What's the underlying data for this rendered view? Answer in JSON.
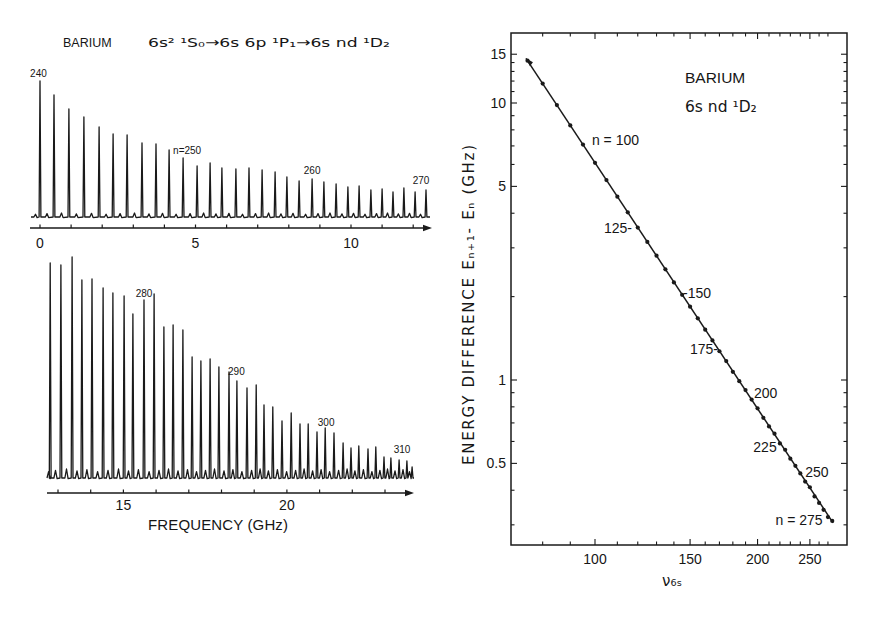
{
  "figure": {
    "left_title_element": "BARIUM",
    "left_title_transition": "6s² ¹S₀→6s 6p  ¹P₁→6s nd  ¹D₂",
    "bottom_xlabel": "FREQUENCY (GHz)",
    "right_legend_line1": "BARIUM",
    "right_legend_line2": "6s nd ¹D₂",
    "right_xlabel": "ν₆ₛ",
    "right_ylabel": "ENERGY DIFFERENCE  Eₙ₊₁- Eₙ  (GHz)"
  },
  "chart_data": [
    {
      "id": "spectrum_top",
      "type": "line",
      "title": "BARIUM 6s² ¹S₀→6s 6p ¹P₁→6s nd ¹D₂",
      "xlabel": "",
      "ylabel": "",
      "xlim": [
        -0.3,
        12.6
      ],
      "grid": false,
      "x_ticks": [
        0,
        1,
        2,
        3,
        4,
        5,
        6,
        7,
        8,
        9,
        10,
        11,
        12
      ],
      "x_tick_labels": [
        0,
        5,
        10
      ],
      "peaks": [
        {
          "n": 240,
          "freq_ghz": 0.0,
          "intensity": 136
        },
        {
          "n": 241,
          "freq_ghz": 0.45,
          "intensity": 122
        },
        {
          "n": 242,
          "freq_ghz": 0.93,
          "intensity": 108
        },
        {
          "n": 243,
          "freq_ghz": 1.41,
          "intensity": 100
        },
        {
          "n": 244,
          "freq_ghz": 1.9,
          "intensity": 90
        },
        {
          "n": 245,
          "freq_ghz": 2.35,
          "intensity": 83
        },
        {
          "n": 246,
          "freq_ghz": 2.8,
          "intensity": 82
        },
        {
          "n": 247,
          "freq_ghz": 3.28,
          "intensity": 74
        },
        {
          "n": 248,
          "freq_ghz": 3.73,
          "intensity": 73
        },
        {
          "n": 249,
          "freq_ghz": 4.15,
          "intensity": 67
        },
        {
          "n": 250,
          "freq_ghz": 4.6,
          "intensity": 59
        },
        {
          "n": 251,
          "freq_ghz": 5.05,
          "intensity": 51
        },
        {
          "n": 252,
          "freq_ghz": 5.47,
          "intensity": 54
        },
        {
          "n": 253,
          "freq_ghz": 5.85,
          "intensity": 49
        },
        {
          "n": 254,
          "freq_ghz": 6.3,
          "intensity": 48
        },
        {
          "n": 255,
          "freq_ghz": 6.72,
          "intensity": 49
        },
        {
          "n": 256,
          "freq_ghz": 7.14,
          "intensity": 47
        },
        {
          "n": 257,
          "freq_ghz": 7.56,
          "intensity": 45
        },
        {
          "n": 258,
          "freq_ghz": 7.94,
          "intensity": 40
        },
        {
          "n": 259,
          "freq_ghz": 8.33,
          "intensity": 36
        },
        {
          "n": 260,
          "freq_ghz": 8.75,
          "intensity": 38
        },
        {
          "n": 261,
          "freq_ghz": 9.13,
          "intensity": 35
        },
        {
          "n": 262,
          "freq_ghz": 9.52,
          "intensity": 33
        },
        {
          "n": 263,
          "freq_ghz": 9.9,
          "intensity": 30
        },
        {
          "n": 264,
          "freq_ghz": 10.26,
          "intensity": 31
        },
        {
          "n": 265,
          "freq_ghz": 10.64,
          "intensity": 27
        },
        {
          "n": 266,
          "freq_ghz": 11.0,
          "intensity": 28
        },
        {
          "n": 267,
          "freq_ghz": 11.35,
          "intensity": 25
        },
        {
          "n": 268,
          "freq_ghz": 11.7,
          "intensity": 29
        },
        {
          "n": 269,
          "freq_ghz": 12.06,
          "intensity": 25
        },
        {
          "n": 270,
          "freq_ghz": 12.41,
          "intensity": 27
        }
      ],
      "annotations": [
        {
          "text": "240",
          "freq_ghz": -0.05,
          "height": 140,
          "anchor": "middle"
        },
        {
          "text": "n=250",
          "freq_ghz": 4.28,
          "height": 63,
          "anchor": "start"
        },
        {
          "text": "260",
          "freq_ghz": 8.75,
          "height": 43,
          "anchor": "middle"
        },
        {
          "text": "270",
          "freq_ghz": 12.25,
          "height": 33,
          "anchor": "middle"
        }
      ]
    },
    {
      "id": "spectrum_bottom",
      "type": "line",
      "title": "",
      "xlabel": "FREQUENCY (GHz)",
      "ylabel": "",
      "xlim": [
        12.65,
        23.9
      ],
      "grid": false,
      "x_ticks": [
        13,
        14,
        15,
        16,
        17,
        18,
        19,
        20,
        21,
        22,
        23
      ],
      "x_tick_labels": [
        15,
        20
      ],
      "peaks": [
        {
          "n": 271,
          "freq_ghz": 12.76,
          "intensity": 215
        },
        {
          "n": 272,
          "freq_ghz": 13.09,
          "intensity": 213
        },
        {
          "n": 273,
          "freq_ghz": 13.43,
          "intensity": 221
        },
        {
          "n": 274,
          "freq_ghz": 13.73,
          "intensity": 198
        },
        {
          "n": 275,
          "freq_ghz": 14.04,
          "intensity": 199
        },
        {
          "n": 276,
          "freq_ghz": 14.38,
          "intensity": 190
        },
        {
          "n": 277,
          "freq_ghz": 14.68,
          "intensity": 185
        },
        {
          "n": 278,
          "freq_ghz": 15.02,
          "intensity": 182
        },
        {
          "n": 279,
          "freq_ghz": 15.29,
          "intensity": 164
        },
        {
          "n": 280,
          "freq_ghz": 15.63,
          "intensity": 178
        },
        {
          "n": 281,
          "freq_ghz": 15.94,
          "intensity": 184
        },
        {
          "n": 282,
          "freq_ghz": 16.24,
          "intensity": 151
        },
        {
          "n": 283,
          "freq_ghz": 16.52,
          "intensity": 153
        },
        {
          "n": 284,
          "freq_ghz": 16.82,
          "intensity": 148
        },
        {
          "n": 285,
          "freq_ghz": 17.1,
          "intensity": 121
        },
        {
          "n": 286,
          "freq_ghz": 17.37,
          "intensity": 117
        },
        {
          "n": 287,
          "freq_ghz": 17.65,
          "intensity": 119
        },
        {
          "n": 288,
          "freq_ghz": 17.92,
          "intensity": 111
        },
        {
          "n": 289,
          "freq_ghz": 18.23,
          "intensity": 106
        },
        {
          "n": 290,
          "freq_ghz": 18.47,
          "intensity": 97
        },
        {
          "n": 291,
          "freq_ghz": 18.78,
          "intensity": 90
        },
        {
          "n": 292,
          "freq_ghz": 19.06,
          "intensity": 93
        },
        {
          "n": 293,
          "freq_ghz": 19.3,
          "intensity": 73
        },
        {
          "n": 294,
          "freq_ghz": 19.57,
          "intensity": 71
        },
        {
          "n": 295,
          "freq_ghz": 19.85,
          "intensity": 57
        },
        {
          "n": 296,
          "freq_ghz": 20.13,
          "intensity": 65
        },
        {
          "n": 297,
          "freq_ghz": 20.4,
          "intensity": 54
        },
        {
          "n": 298,
          "freq_ghz": 20.65,
          "intensity": 54
        },
        {
          "n": 299,
          "freq_ghz": 20.92,
          "intensity": 46
        },
        {
          "n": 300,
          "freq_ghz": 21.17,
          "intensity": 50
        },
        {
          "n": 301,
          "freq_ghz": 21.44,
          "intensity": 45
        },
        {
          "n": 302,
          "freq_ghz": 21.72,
          "intensity": 35
        },
        {
          "n": 303,
          "freq_ghz": 21.96,
          "intensity": 30
        },
        {
          "n": 304,
          "freq_ghz": 22.2,
          "intensity": 32
        },
        {
          "n": 305,
          "freq_ghz": 22.48,
          "intensity": 29
        },
        {
          "n": 306,
          "freq_ghz": 22.72,
          "intensity": 31
        },
        {
          "n": 307,
          "freq_ghz": 22.97,
          "intensity": 21
        },
        {
          "n": 308,
          "freq_ghz": 23.18,
          "intensity": 20
        },
        {
          "n": 309,
          "freq_ghz": 23.43,
          "intensity": 18
        },
        {
          "n": 310,
          "freq_ghz": 23.67,
          "intensity": 17
        },
        {
          "n": 311,
          "freq_ghz": 23.83,
          "intensity": 11
        }
      ],
      "annotations": [
        {
          "text": "280",
          "freq_ghz": 15.63,
          "height": 181,
          "anchor": "middle"
        },
        {
          "text": "290",
          "freq_ghz": 18.2,
          "height": 103,
          "anchor": "start"
        },
        {
          "text": "300",
          "freq_ghz": 21.2,
          "height": 52,
          "anchor": "middle"
        },
        {
          "text": "310",
          "freq_ghz": 23.52,
          "height": 25,
          "anchor": "middle"
        }
      ]
    },
    {
      "id": "energy_difference",
      "type": "scatter",
      "title": "",
      "legend": [
        "BARIUM",
        "6s nd ¹D₂"
      ],
      "xlabel": "ν₆ₛ",
      "ylabel": "ENERGY DIFFERENCE Eₙ₊₁ - Eₙ (GHz)",
      "x_scale": "log",
      "y_scale": "log",
      "xlim": [
        70,
        293
      ],
      "ylim": [
        0.254,
        17.9
      ],
      "grid": false,
      "x_ticks": [
        80,
        90,
        100,
        110,
        120,
        130,
        140,
        150,
        160,
        170,
        180,
        190,
        200,
        210,
        220,
        230,
        240,
        250,
        260,
        270
      ],
      "x_tick_labels": [
        100,
        150,
        200,
        250
      ],
      "y_ticks": [
        0.3,
        0.4,
        0.5,
        0.6,
        0.7,
        0.8,
        0.9,
        1,
        2,
        3,
        4,
        5,
        6,
        7,
        8,
        9,
        10,
        11,
        12,
        13,
        14,
        15
      ],
      "y_tick_labels": [
        0.5,
        1,
        5,
        10,
        15
      ],
      "fit_line": {
        "x": [
          74.5,
          276
        ],
        "y": [
          14.5,
          0.305
        ]
      },
      "points": {
        "x": [
          75,
          80,
          85,
          90,
          95,
          100,
          105,
          110,
          115,
          120,
          125,
          130,
          135,
          140,
          145,
          150,
          155,
          160,
          165,
          170,
          175,
          180,
          185,
          190,
          195,
          200,
          205,
          210,
          215,
          220,
          225,
          230,
          235,
          240,
          245,
          250,
          255,
          260,
          265,
          270,
          275
        ],
        "y": [
          14.22,
          11.75,
          9.83,
          8.3,
          7.08,
          6.08,
          5.27,
          4.59,
          4.03,
          3.55,
          3.15,
          2.81,
          2.51,
          2.25,
          2.03,
          1.84,
          1.67,
          1.52,
          1.39,
          1.27,
          1.17,
          1.07,
          0.99,
          0.92,
          0.85,
          0.79,
          0.73,
          0.68,
          0.64,
          0.59,
          0.56,
          0.52,
          0.49,
          0.46,
          0.43,
          0.41,
          0.38,
          0.36,
          0.34,
          0.32,
          0.31
        ]
      },
      "annotations": [
        {
          "text": "n = 100",
          "nu": 98.7,
          "E": 7.36,
          "anchor": "start"
        },
        {
          "text": "125-",
          "nu": 117.1,
          "E": 3.54,
          "anchor": "end"
        },
        {
          "text": "-150",
          "nu": 145.6,
          "E": 2.06,
          "anchor": "start"
        },
        {
          "text": "175-",
          "nu": 169.0,
          "E": 1.29,
          "anchor": "end"
        },
        {
          "text": "200",
          "nu": 197.0,
          "E": 0.9,
          "anchor": "start"
        },
        {
          "text": "225",
          "nu": 217.0,
          "E": 0.573,
          "anchor": "end"
        },
        {
          "text": "250",
          "nu": 245.0,
          "E": 0.465,
          "anchor": "start"
        },
        {
          "text": "n = 275",
          "nu": 264.0,
          "E": 0.312,
          "anchor": "end"
        }
      ]
    }
  ]
}
